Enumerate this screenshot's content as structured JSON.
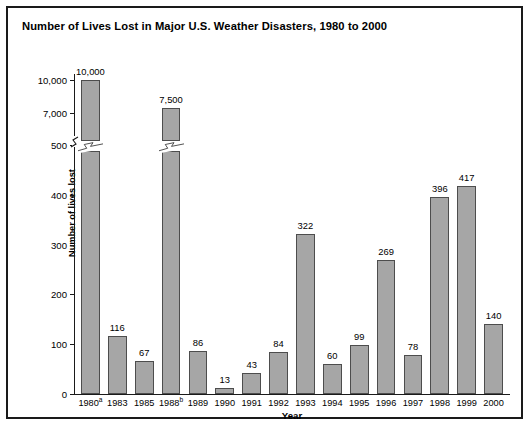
{
  "chart_data": {
    "type": "bar",
    "title": "Number of Lives Lost in Major U.S. Weather Disasters, 1980 to 2000",
    "xlabel": "Year",
    "ylabel": "Number of lives lost",
    "grid": false,
    "legend": "none",
    "axis_break": {
      "present": true,
      "between": [
        500,
        7000
      ],
      "note": "y-axis is broken between 500 and 7,000; the 1980 and 1988 bars are drawn with break marks"
    },
    "ytick_labels": [
      "0",
      "100",
      "200",
      "300",
      "400",
      "500",
      "7,000",
      "10,000"
    ],
    "ytick_values": [
      0,
      100,
      200,
      300,
      400,
      500,
      7000,
      10000
    ],
    "ylim": [
      0,
      10000
    ],
    "categories": [
      "1980",
      "1983",
      "1985",
      "1988",
      "1989",
      "1990",
      "1991",
      "1992",
      "1993",
      "1994",
      "1995",
      "1996",
      "1997",
      "1998",
      "1999",
      "2000"
    ],
    "category_footnotes": [
      "a",
      "",
      "",
      "b",
      "",
      "",
      "",
      "",
      "",
      "",
      "",
      "",
      "",
      "",
      "",
      ""
    ],
    "values": [
      10000,
      116,
      67,
      7500,
      86,
      13,
      43,
      84,
      322,
      60,
      99,
      269,
      78,
      396,
      417,
      140
    ],
    "value_labels": [
      "10,000",
      "116",
      "67",
      "7,500",
      "86",
      "13",
      "43",
      "84",
      "322",
      "60",
      "99",
      "269",
      "78",
      "396",
      "417",
      "140"
    ],
    "colors": {
      "bar_fill": "#a6a6a6",
      "bar_border": "#4d4d4d",
      "axis": "#1a1a1a",
      "text": "#000000",
      "background": "#ffffff",
      "frame_border": "#1a1a1a"
    }
  }
}
